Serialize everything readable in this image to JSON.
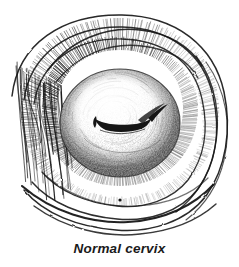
{
  "figure": {
    "caption": "Normal cervix",
    "subject": "cervix",
    "medium": "pen-and-ink line drawing with hatching and stipple shading",
    "background_color": "#ffffff",
    "ink_color": "#151515",
    "shading_color": "#3a3a3a"
  },
  "illustration": {
    "title": "normal-cervix-drawing",
    "parts": [
      {
        "name": "outer-vaginal-fold-1",
        "label": "outermost vaginal wall fold",
        "type": "contour-arc"
      },
      {
        "name": "outer-vaginal-fold-2",
        "label": "second vaginal wall fold",
        "type": "contour-arc"
      },
      {
        "name": "outer-vaginal-fold-3",
        "label": "third vaginal wall fold",
        "type": "contour-arc"
      },
      {
        "name": "vaginal-fornix-rim",
        "label": "vaginal fornix rim with dense hatching",
        "type": "hatched-band"
      },
      {
        "name": "cervix-body",
        "label": "cervix body (portio vaginalis)",
        "type": "stippled-ellipse"
      },
      {
        "name": "cervical-os",
        "label": "cervical os (transverse slit)",
        "type": "slit"
      },
      {
        "name": "speck-mark",
        "label": "ink speck below cervix",
        "type": "dot"
      }
    ]
  },
  "geometry": {
    "canvas": {
      "width": 239,
      "height": 267
    },
    "illustration_box": {
      "x": 0,
      "y": 0,
      "width": 239,
      "height": 238
    },
    "cervix_center": {
      "x": 120,
      "y": 123
    },
    "cervix_radius": {
      "rx": 60,
      "ry": 54
    },
    "os_center": {
      "x": 122,
      "y": 124
    },
    "os_length": 58,
    "speck": {
      "x": 120,
      "y": 200,
      "r": 1.6
    },
    "caption_baseline_y": 255
  }
}
